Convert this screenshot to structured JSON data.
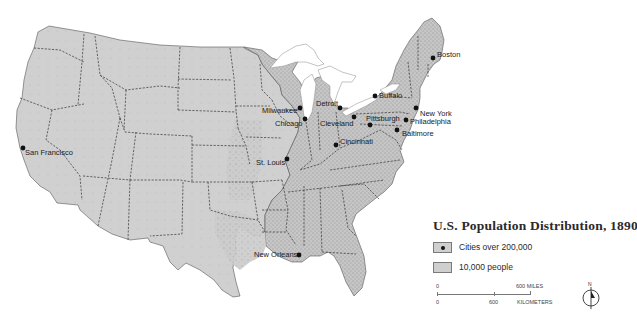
{
  "map": {
    "title": "U.S. Population Distribution, 1890",
    "colors": {
      "land": "#cfcfcf",
      "land_dense": "#bdbdbd",
      "water": "#ffffff",
      "border": "#333333",
      "city_dot": "#111111"
    },
    "cities": [
      {
        "name": "Boston",
        "x": 433,
        "y": 58
      },
      {
        "name": "Buffalo",
        "x": 375,
        "y": 96
      },
      {
        "name": "New York",
        "x": 416,
        "y": 108
      },
      {
        "name": "Philadelphia",
        "x": 406,
        "y": 120
      },
      {
        "name": "Baltimore",
        "x": 397,
        "y": 130
      },
      {
        "name": "Pittsburgh",
        "x": 370,
        "y": 125
      },
      {
        "name": "Cleveland",
        "x": 354,
        "y": 117
      },
      {
        "name": "Detroit",
        "x": 340,
        "y": 108
      },
      {
        "name": "Milwaukee",
        "x": 300,
        "y": 108
      },
      {
        "name": "Chicago",
        "x": 305,
        "y": 119
      },
      {
        "name": "Cincinnati",
        "x": 336,
        "y": 145
      },
      {
        "name": "St. Louis",
        "x": 287,
        "y": 159
      },
      {
        "name": "San Francisco",
        "x": 23,
        "y": 148
      },
      {
        "name": "New Orleans",
        "x": 299,
        "y": 255
      }
    ]
  },
  "legend": {
    "title": "U.S. Population Distribution, 1890",
    "items": [
      {
        "symbol": "city-dot",
        "label": "Cities over 200,000"
      },
      {
        "symbol": "area-swatch",
        "label": "10,000 people"
      }
    ]
  },
  "scale": {
    "miles_start": "0",
    "miles_end": "600 MILES",
    "km_start": "0",
    "km_mid": "600",
    "km_unit": "KILOMETERS"
  },
  "north_arrow": {
    "label": "N"
  }
}
